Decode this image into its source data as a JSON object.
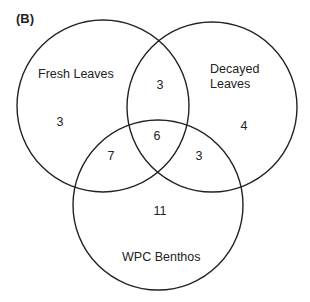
{
  "panel_label": "(B)",
  "sets": [
    {
      "name": "Fresh Leaves",
      "cx": 103,
      "cy": 106,
      "r": 86
    },
    {
      "name": "Decayed Leaves",
      "line1": "Decayed",
      "line2": "Leaves",
      "cx": 212,
      "cy": 107,
      "r": 85
    },
    {
      "name": "WPC Benthos",
      "cx": 158,
      "cy": 205,
      "r": 85
    }
  ],
  "regions": {
    "fresh_only": "3",
    "decayed_only": "4",
    "benthos_only": "11",
    "fresh_decayed": "3",
    "fresh_benthos": "7",
    "decayed_benthos": "3",
    "all_three": "6"
  },
  "style": {
    "stroke": "#222222",
    "stroke_width": 1.4
  }
}
